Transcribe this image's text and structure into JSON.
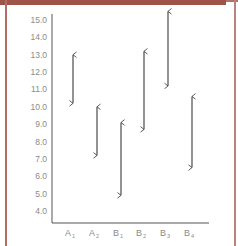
{
  "chart_data": {
    "type": "range",
    "title": "",
    "xlabel": "",
    "ylabel": "",
    "categories": [
      "A1",
      "A2",
      "B1",
      "B2",
      "B3",
      "B4"
    ],
    "category_labels": [
      {
        "base": "A",
        "sub": "1"
      },
      {
        "base": "A",
        "sub": "2"
      },
      {
        "base": "B",
        "sub": "1"
      },
      {
        "base": "B",
        "sub": "2"
      },
      {
        "base": "B",
        "sub": "3"
      },
      {
        "base": "B",
        "sub": "4"
      }
    ],
    "series": [
      {
        "name": "range_low",
        "values": [
          10.2,
          7.2,
          4.9,
          8.7,
          11.2,
          6.5
        ]
      },
      {
        "name": "range_high",
        "values": [
          13.0,
          10.0,
          9.1,
          13.2,
          15.5,
          10.6
        ]
      }
    ],
    "yticks": [
      "15.0",
      "14.0",
      "13.0",
      "12.0",
      "11.0",
      "10.0",
      "9.0",
      "8.0",
      "7.0",
      "6.0",
      "5.0",
      "4.0"
    ],
    "ylim": [
      3.3,
      15.6
    ],
    "grid": false,
    "legend": null,
    "marker": "double-headed-arrow"
  },
  "colors": {
    "frame": "#9e5349",
    "axis": "#555555",
    "arrow": "#4a4a4a",
    "text": "#8a8a8a"
  }
}
